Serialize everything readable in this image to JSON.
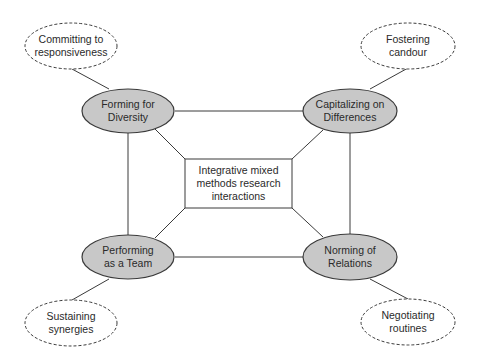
{
  "diagram": {
    "center": {
      "label_lines": [
        "Integrative mixed",
        "methods research",
        "interactions"
      ]
    },
    "stages": [
      {
        "id": "forming",
        "label_lines": [
          "Forming for",
          "Diversity"
        ]
      },
      {
        "id": "capitalizing",
        "label_lines": [
          "Capitalizing on",
          "Differences"
        ]
      },
      {
        "id": "performing",
        "label_lines": [
          "Performing",
          "as a Team"
        ]
      },
      {
        "id": "norming",
        "label_lines": [
          "Norming of",
          "Relations"
        ]
      }
    ],
    "outcomes": [
      {
        "id": "committing",
        "label_lines": [
          "Committing to",
          "responsiveness"
        ]
      },
      {
        "id": "fostering",
        "label_lines": [
          "Fostering",
          "candour"
        ]
      },
      {
        "id": "sustaining",
        "label_lines": [
          "Sustaining",
          "synergies"
        ]
      },
      {
        "id": "negotiating",
        "label_lines": [
          "Negotiating",
          "routines"
        ]
      }
    ],
    "colors": {
      "stage_fill": "#c8c8c8",
      "stroke": "#3a3a3a",
      "background": "#ffffff"
    }
  }
}
